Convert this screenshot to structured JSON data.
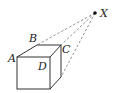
{
  "diagram": {
    "type": "cube-perspective",
    "colors": {
      "line": "#333333",
      "dashed": "#777777",
      "point": "#111111",
      "background": "#ffffff"
    },
    "labels": {
      "A": "A",
      "B": "B",
      "C": "C",
      "D": "D",
      "X": "X"
    },
    "point": {
      "name": "X"
    },
    "cube_vertices": [
      "A",
      "B",
      "C",
      "D"
    ],
    "dashed_lines_from": "X",
    "dashed_line_count": 3
  }
}
